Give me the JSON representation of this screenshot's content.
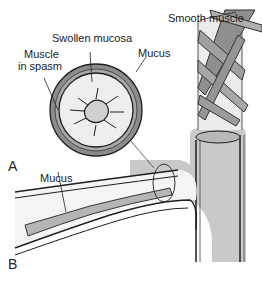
{
  "figure": {
    "labels": {
      "smooth_muscle": "Smooth muscle",
      "swollen_mucosa": "Swollen mucosa",
      "mucus_top": "Mucus",
      "muscle_line1": "Muscle",
      "muscle_line2": "in spasm",
      "mucus_bottom": "Mucus"
    },
    "panels": {
      "a": "A",
      "b": "B"
    },
    "colors": {
      "wall_gray": "#8a8a8a",
      "lumen_light": "#e6e6e6",
      "airway_fill": "#c8c8c8",
      "outline": "#1e1e1e"
    }
  }
}
